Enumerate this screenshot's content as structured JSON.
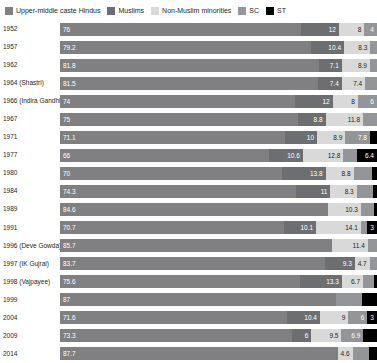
{
  "legend": {
    "items": [
      {
        "label": "Upper-middle caste Hindus",
        "color": "#808083",
        "swatch_icon": "square-swatch-icon"
      },
      {
        "label": "Muslims",
        "color": "#6d6e71",
        "swatch_icon": "square-swatch-icon"
      },
      {
        "label": "Non-Muslim minorities",
        "color": "#d9d9d9",
        "swatch_icon": "square-swatch-icon"
      },
      {
        "label": "SC",
        "color": "#939598",
        "swatch_icon": "square-swatch-icon"
      },
      {
        "label": "ST",
        "color": "#000000",
        "swatch_icon": "square-swatch-icon"
      }
    ]
  },
  "chart_data": {
    "type": "bar",
    "orientation": "horizontal",
    "stacked": true,
    "title": "",
    "xlabel": "",
    "ylabel": "",
    "xlim": [
      0,
      100
    ],
    "grid": false,
    "legend_position": "top-left",
    "categories": [
      "1952",
      "1957",
      "1962",
      "1964 (Shastri)",
      "1966 (Indira Gandhi)",
      "1967",
      "1971",
      "1977",
      "1980",
      "1984",
      "1989",
      "1991",
      "1996 (Deve Gowda)",
      "1997 (IK Gujral)",
      "1998 (Vajpayee)",
      "1999",
      "2004",
      "2009",
      "2014"
    ],
    "series": [
      {
        "name": "Upper-middle caste Hindus",
        "color": "#808083",
        "values": [
          76,
          79.2,
          81.8,
          81.5,
          74,
          75,
          71.1,
          66,
          70,
          74.3,
          84.6,
          70.7,
          85.7,
          83.7,
          75.6,
          87,
          71.6,
          73.3,
          87.7
        ]
      },
      {
        "name": "Muslims",
        "color": "#6d6e71",
        "values": [
          12,
          10.4,
          7.1,
          7.4,
          12,
          8.8,
          10,
          10.6,
          13.8,
          11,
          0,
          10.1,
          0,
          9.3,
          13.3,
          0,
          10.4,
          6,
          0
        ]
      },
      {
        "name": "Non-Muslim minorities",
        "color": "#d9d9d9",
        "values": [
          8,
          8.3,
          8.9,
          7.4,
          8,
          11.8,
          8.9,
          12.8,
          8.8,
          8.3,
          10.3,
          14.1,
          11.4,
          4.7,
          6.7,
          0,
          9,
          9.5,
          4.6
        ]
      },
      {
        "name": "SC",
        "color": "#939598",
        "values": [
          4,
          2.1,
          2.2,
          3.7,
          6,
          4.4,
          7.8,
          4.2,
          5.9,
          5.2,
          4.1,
          2.1,
          2.9,
          2.3,
          3.5,
          8.4,
          6,
          6.9,
          5.3
        ]
      },
      {
        "name": "ST",
        "color": "#000000",
        "values": [
          0,
          0,
          0,
          0,
          0,
          0,
          2.2,
          6.4,
          1.5,
          1.2,
          1,
          3,
          0,
          0,
          0.9,
          4.6,
          3,
          4.3,
          2.4
        ]
      }
    ],
    "labeled_values": [
      {
        "year": "1952",
        "labels": [
          {
            "s": 0,
            "t": "76"
          },
          {
            "s": 1,
            "t": "12"
          },
          {
            "s": 2,
            "t": "8"
          },
          {
            "s": 3,
            "t": "4"
          },
          {
            "s": 4,
            "t": ""
          }
        ]
      },
      {
        "year": "1957",
        "labels": [
          {
            "s": 0,
            "t": "79.2"
          },
          {
            "s": 1,
            "t": "10.4"
          },
          {
            "s": 2,
            "t": "8.3"
          },
          {
            "s": 3,
            "t": ""
          },
          {
            "s": 4,
            "t": ""
          }
        ]
      },
      {
        "year": "1962",
        "labels": [
          {
            "s": 0,
            "t": "81.8"
          },
          {
            "s": 1,
            "t": "7.1"
          },
          {
            "s": 2,
            "t": "8.9"
          },
          {
            "s": 3,
            "t": ""
          },
          {
            "s": 4,
            "t": ""
          }
        ]
      },
      {
        "year": "1964 (Shastri)",
        "labels": [
          {
            "s": 0,
            "t": "81.5"
          },
          {
            "s": 1,
            "t": "7.4"
          },
          {
            "s": 2,
            "t": "7.4"
          },
          {
            "s": 3,
            "t": ""
          },
          {
            "s": 4,
            "t": ""
          }
        ]
      },
      {
        "year": "1966 (Indira Gandhi)",
        "labels": [
          {
            "s": 0,
            "t": "74"
          },
          {
            "s": 1,
            "t": "12"
          },
          {
            "s": 2,
            "t": "8"
          },
          {
            "s": 3,
            "t": "6"
          },
          {
            "s": 4,
            "t": ""
          }
        ]
      },
      {
        "year": "1967",
        "labels": [
          {
            "s": 0,
            "t": "75"
          },
          {
            "s": 1,
            "t": "8.8"
          },
          {
            "s": 2,
            "t": "11.8"
          },
          {
            "s": 3,
            "t": ""
          },
          {
            "s": 4,
            "t": ""
          }
        ]
      },
      {
        "year": "1971",
        "labels": [
          {
            "s": 0,
            "t": "71.1"
          },
          {
            "s": 1,
            "t": "10"
          },
          {
            "s": 2,
            "t": "8.9"
          },
          {
            "s": 3,
            "t": "7.8"
          },
          {
            "s": 4,
            "t": ""
          }
        ]
      },
      {
        "year": "1977",
        "labels": [
          {
            "s": 0,
            "t": "66"
          },
          {
            "s": 1,
            "t": "10.6"
          },
          {
            "s": 2,
            "t": "12.8"
          },
          {
            "s": 3,
            "t": ""
          },
          {
            "s": 4,
            "t": "6.4"
          }
        ]
      },
      {
        "year": "1980",
        "labels": [
          {
            "s": 0,
            "t": "70"
          },
          {
            "s": 1,
            "t": "13.8"
          },
          {
            "s": 2,
            "t": "8.8"
          },
          {
            "s": 3,
            "t": ""
          },
          {
            "s": 4,
            "t": ""
          }
        ]
      },
      {
        "year": "1984",
        "labels": [
          {
            "s": 0,
            "t": "74.3"
          },
          {
            "s": 1,
            "t": "11"
          },
          {
            "s": 2,
            "t": "8.3"
          },
          {
            "s": 3,
            "t": ""
          },
          {
            "s": 4,
            "t": ""
          }
        ]
      },
      {
        "year": "1989",
        "labels": [
          {
            "s": 0,
            "t": "84.6"
          },
          {
            "s": 1,
            "t": ""
          },
          {
            "s": 2,
            "t": "10.3"
          },
          {
            "s": 3,
            "t": ""
          },
          {
            "s": 4,
            "t": ""
          }
        ]
      },
      {
        "year": "1991",
        "labels": [
          {
            "s": 0,
            "t": "70.7"
          },
          {
            "s": 1,
            "t": "10.1"
          },
          {
            "s": 2,
            "t": "14.1"
          },
          {
            "s": 3,
            "t": ""
          },
          {
            "s": 4,
            "t": "3"
          }
        ]
      },
      {
        "year": "1996 (Deve Gowda)",
        "labels": [
          {
            "s": 0,
            "t": "85.7"
          },
          {
            "s": 1,
            "t": ""
          },
          {
            "s": 2,
            "t": "11.4"
          },
          {
            "s": 3,
            "t": ""
          },
          {
            "s": 4,
            "t": ""
          }
        ]
      },
      {
        "year": "1997 (IK Gujral)",
        "labels": [
          {
            "s": 0,
            "t": "83.7"
          },
          {
            "s": 1,
            "t": "9.3"
          },
          {
            "s": 2,
            "t": "4.7"
          },
          {
            "s": 3,
            "t": ""
          },
          {
            "s": 4,
            "t": ""
          }
        ]
      },
      {
        "year": "1998 (Vajpayee)",
        "labels": [
          {
            "s": 0,
            "t": "75.6"
          },
          {
            "s": 1,
            "t": "13.3"
          },
          {
            "s": 2,
            "t": "6.7"
          },
          {
            "s": 3,
            "t": ""
          },
          {
            "s": 4,
            "t": ""
          }
        ]
      },
      {
        "year": "1999",
        "labels": [
          {
            "s": 0,
            "t": "87"
          },
          {
            "s": 1,
            "t": ""
          },
          {
            "s": 2,
            "t": ""
          },
          {
            "s": 3,
            "t": ""
          },
          {
            "s": 4,
            "t": ""
          }
        ]
      },
      {
        "year": "2004",
        "labels": [
          {
            "s": 0,
            "t": "71.6"
          },
          {
            "s": 1,
            "t": "10.4"
          },
          {
            "s": 2,
            "t": "9"
          },
          {
            "s": 3,
            "t": "6"
          },
          {
            "s": 4,
            "t": "3"
          }
        ]
      },
      {
        "year": "2009",
        "labels": [
          {
            "s": 0,
            "t": "73.3"
          },
          {
            "s": 1,
            "t": "6"
          },
          {
            "s": 2,
            "t": "9.5"
          },
          {
            "s": 3,
            "t": "6.9"
          },
          {
            "s": 4,
            "t": ""
          }
        ]
      },
      {
        "year": "2014",
        "labels": [
          {
            "s": 0,
            "t": "87.7"
          },
          {
            "s": 1,
            "t": ""
          },
          {
            "s": 2,
            "t": "4.6"
          },
          {
            "s": 3,
            "t": ""
          },
          {
            "s": 4,
            "t": ""
          }
        ]
      }
    ]
  }
}
